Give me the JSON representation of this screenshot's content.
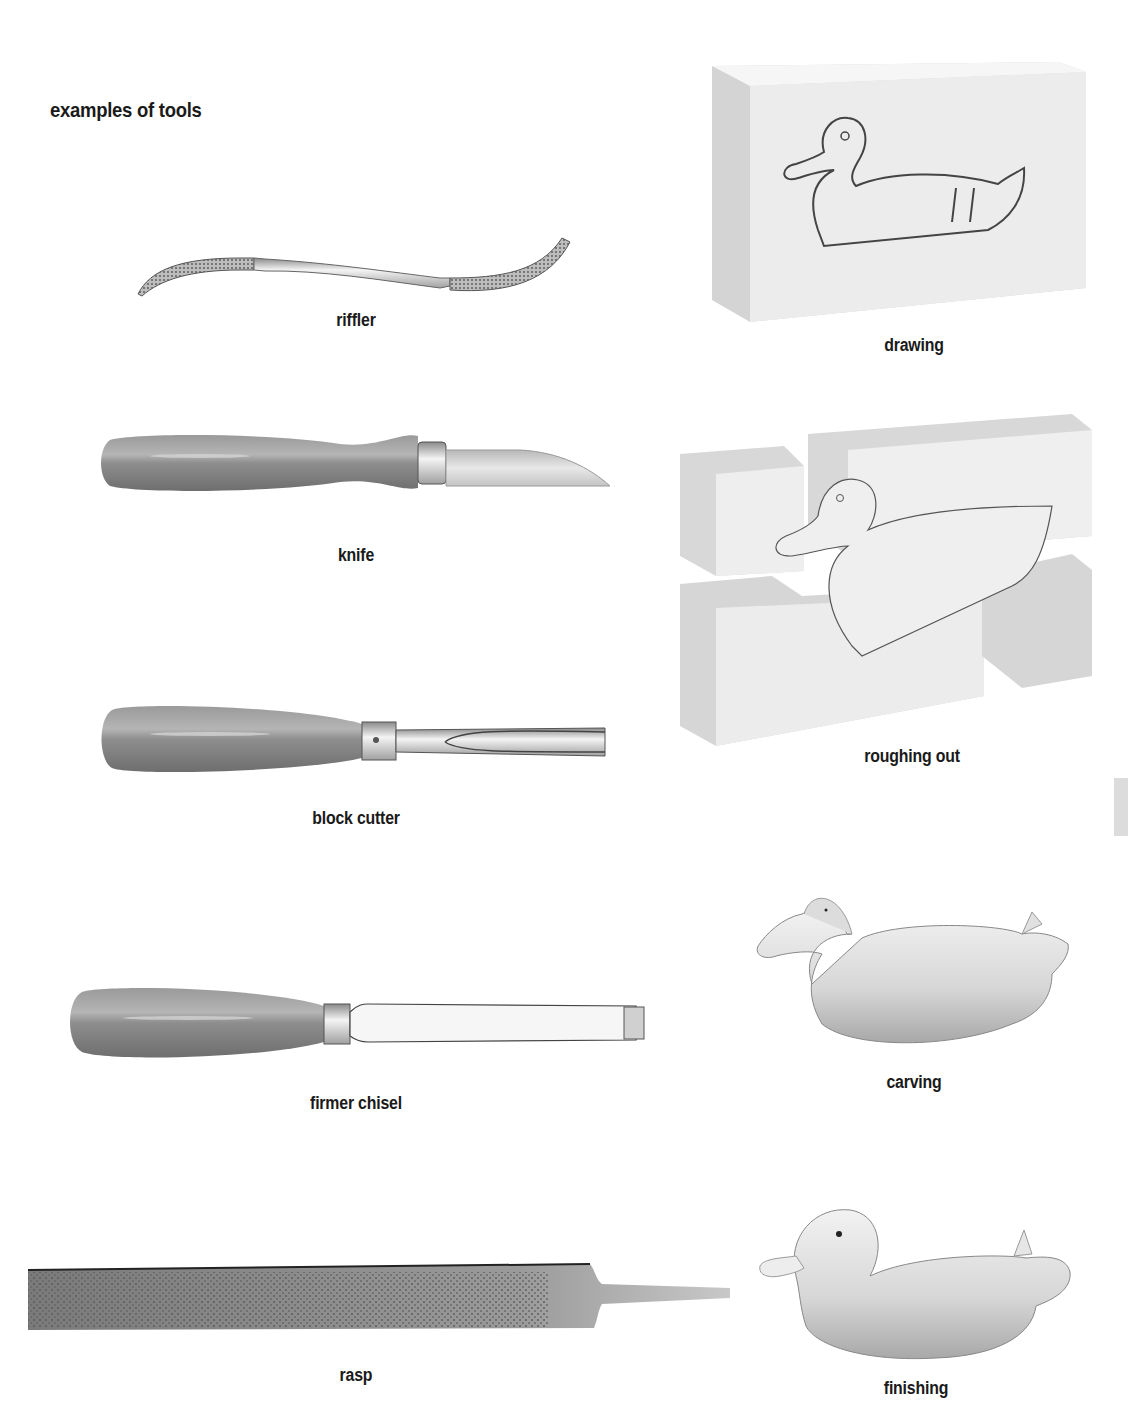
{
  "section": {
    "title": "examples of tools"
  },
  "tools": [
    {
      "id": "riffler",
      "label": "riffler"
    },
    {
      "id": "knife",
      "label": "knife"
    },
    {
      "id": "block-cutter",
      "label": "block cutter"
    },
    {
      "id": "firmer-chisel",
      "label": "firmer chisel"
    },
    {
      "id": "rasp",
      "label": "rasp"
    }
  ],
  "steps": [
    {
      "id": "drawing",
      "label": "drawing"
    },
    {
      "id": "roughing-out",
      "label": "roughing out"
    },
    {
      "id": "carving",
      "label": "carving"
    },
    {
      "id": "finishing",
      "label": "finishing"
    }
  ],
  "colors": {
    "text": "#1a1a1a",
    "handle": "#8a8a8a",
    "metal": "#d8d8d8",
    "block": "#e6e6e6",
    "tab": "#dcdcdc"
  }
}
